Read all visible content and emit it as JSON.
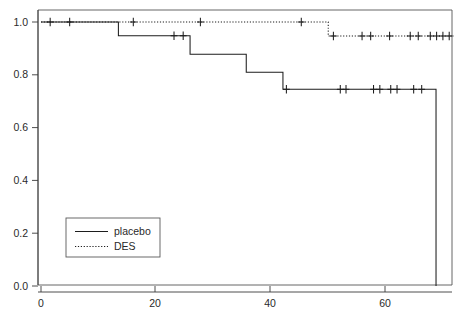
{
  "chart_data": {
    "type": "line",
    "subtype": "kaplan-meier-step",
    "title": "",
    "subtitle": "",
    "xlabel": "",
    "ylabel": "",
    "xlim": [
      0,
      72
    ],
    "ylim": [
      0.0,
      1.05
    ],
    "grid": false,
    "frame": true,
    "legend_position": "bottom-left",
    "xticks": [
      0,
      20,
      40,
      60
    ],
    "xtick_labels": [
      "0",
      "20",
      "40",
      "60"
    ],
    "yticks": [
      0.0,
      0.2,
      0.4,
      0.6,
      0.8,
      1.0
    ],
    "ytick_labels": [
      "0.0",
      "0.2",
      "0.4",
      "0.6",
      "0.8",
      "1.0"
    ],
    "series": [
      {
        "name": "placebo",
        "legend_label": "placebo",
        "line_style": "solid",
        "color": "#1d1d1d",
        "step_points": [
          [
            0,
            1.0
          ],
          [
            13.5,
            1.0
          ],
          [
            13.5,
            0.948
          ],
          [
            26.0,
            0.948
          ],
          [
            26.0,
            0.878
          ],
          [
            35.8,
            0.878
          ],
          [
            35.8,
            0.81
          ],
          [
            42.2,
            0.81
          ],
          [
            42.2,
            0.745
          ],
          [
            68.9,
            0.745
          ],
          [
            68.9,
            0.0
          ]
        ],
        "censor_times": [
          1.6,
          5.0,
          23.2,
          24.8,
          42.8,
          52.2,
          53.2,
          58.0,
          59.1,
          61.0,
          62.1,
          65.0,
          66.4
        ],
        "censor_values": [
          1.0,
          1.0,
          0.948,
          0.948,
          0.745,
          0.745,
          0.745,
          0.745,
          0.745,
          0.745,
          0.745,
          0.745,
          0.745
        ]
      },
      {
        "name": "DES",
        "legend_label": "DES",
        "line_style": "dotted",
        "color": "#1d1d1d",
        "step_points": [
          [
            0,
            1.0
          ],
          [
            50.1,
            1.0
          ],
          [
            50.1,
            0.947
          ],
          [
            72.0,
            0.947
          ]
        ],
        "censor_times": [
          16.1,
          27.8,
          45.4,
          51.0,
          56.0,
          57.5,
          60.8,
          64.4,
          65.8,
          67.9,
          69.0,
          70.1,
          71.2
        ],
        "censor_values": [
          1.0,
          1.0,
          1.0,
          0.947,
          0.947,
          0.947,
          0.947,
          0.947,
          0.947,
          0.947,
          0.947,
          0.947,
          0.947
        ]
      }
    ]
  },
  "legend": {
    "entries": [
      {
        "label": "placebo",
        "style": "solid"
      },
      {
        "label": "DES",
        "style": "dotted"
      }
    ]
  },
  "axes": {
    "x_tick_labels": [
      "0",
      "20",
      "40",
      "60"
    ],
    "y_tick_labels": [
      "1.0",
      "0.8",
      "0.6",
      "0.4",
      "0.2",
      "0.0"
    ]
  },
  "colors": {
    "background": "#ffffff",
    "axis": "#3a3a3a",
    "frame": "#555555",
    "curve": "#1d1d1d",
    "text": "#2a2a2a"
  }
}
